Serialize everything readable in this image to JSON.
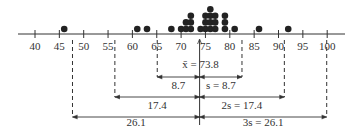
{
  "chart_data": {
    "type": "scatter",
    "subtype": "dot-plot",
    "title": "",
    "xlabel": "",
    "ylabel": "",
    "xlim": [
      40,
      100
    ],
    "x_ticks": [
      40,
      45,
      50,
      55,
      60,
      65,
      70,
      75,
      80,
      85,
      90,
      95,
      100
    ],
    "grid": false,
    "legend": null,
    "points": [
      {
        "x": 46,
        "count": 1
      },
      {
        "x": 61,
        "count": 1
      },
      {
        "x": 63,
        "count": 1
      },
      {
        "x": 68,
        "count": 1
      },
      {
        "x": 70,
        "count": 1
      },
      {
        "x": 71,
        "count": 2
      },
      {
        "x": 72,
        "count": 3
      },
      {
        "x": 74,
        "count": 1
      },
      {
        "x": 75,
        "count": 3
      },
      {
        "x": 76,
        "count": 4
      },
      {
        "x": 77,
        "count": 3
      },
      {
        "x": 79,
        "count": 3
      },
      {
        "x": 81,
        "count": 1
      },
      {
        "x": 86,
        "count": 1
      },
      {
        "x": 92,
        "count": 1
      }
    ],
    "mean": 73.8,
    "std_dev": 8.7,
    "annotations": {
      "mean_label": "x̄ = 73.8",
      "one_sd": {
        "left_label": "8.7",
        "right_label": "s = 8.7",
        "range": [
          65.1,
          82.5
        ]
      },
      "two_sd": {
        "left_label": "17.4",
        "right_label": "2s = 17.4",
        "range": [
          56.4,
          91.2
        ]
      },
      "three_sd": {
        "left_label": "26.1",
        "right_label": "3s = 26.1",
        "range": [
          47.7,
          99.9
        ]
      }
    }
  },
  "colors": {
    "ink": "#333333",
    "dot": "#222222",
    "background": "#ffffff"
  }
}
